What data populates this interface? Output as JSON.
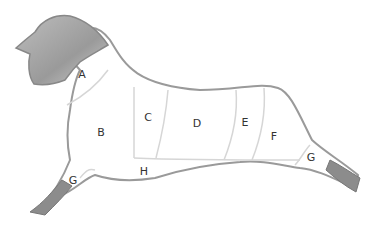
{
  "diagram": {
    "colors": {
      "outline": "#9a9a9a",
      "head_fill": "#a9a9a9",
      "hoof_fill": "#8c8c8c",
      "body_fill": "#ffffff",
      "divider": "#d6d6d6",
      "label": "#333333"
    },
    "regions": [
      {
        "id": "A",
        "label": "A",
        "x": 82,
        "y": 74
      },
      {
        "id": "B",
        "label": "B",
        "x": 101,
        "y": 132
      },
      {
        "id": "C",
        "label": "C",
        "x": 148,
        "y": 117
      },
      {
        "id": "D",
        "label": "D",
        "x": 197,
        "y": 123
      },
      {
        "id": "E",
        "label": "E",
        "x": 245,
        "y": 122
      },
      {
        "id": "F",
        "label": "F",
        "x": 274,
        "y": 136
      },
      {
        "id": "G-rear",
        "label": "G",
        "x": 311,
        "y": 157
      },
      {
        "id": "G-front",
        "label": "G",
        "x": 73,
        "y": 180
      },
      {
        "id": "H",
        "label": "H",
        "x": 144,
        "y": 171
      }
    ]
  }
}
